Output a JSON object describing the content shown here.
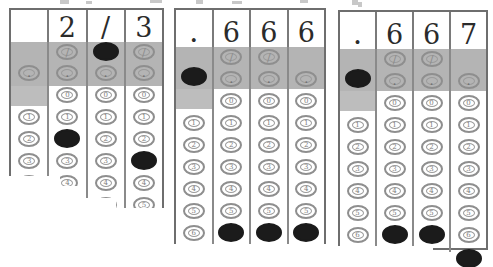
{
  "document": {
    "kind": "scanned-answer-grids",
    "description": "Three standardized test grid-in answer boxes showing equivalent answers for two thirds",
    "grid_count": 3
  },
  "colors": {
    "page_background": "#ffffff",
    "grid_border": "#6e6e6e",
    "column_divider": "#8a8a8a",
    "shaded_band": "#b4b4b4",
    "bubble_outline": "#8e8e8e",
    "bubble_filled": "#1b1b1b",
    "handwriting": "#2b2b2b"
  },
  "bubble_labels": {
    "slash": "/",
    "decimal": ".",
    "digits": [
      "0",
      "1",
      "2",
      "3",
      "4",
      "5",
      "6",
      "7",
      "8",
      "9"
    ]
  },
  "grids": [
    {
      "id": "grid-1",
      "answer": "2/3",
      "written": [
        "",
        "2",
        "/",
        "3"
      ],
      "columns": [
        {
          "index": 1,
          "written": "",
          "has_slash": false,
          "has_decimal": true,
          "filled": null
        },
        {
          "index": 2,
          "written": "2",
          "has_slash": true,
          "has_decimal": true,
          "filled": "2"
        },
        {
          "index": 3,
          "written": "/",
          "has_slash": true,
          "has_decimal": true,
          "filled": "slash"
        },
        {
          "index": 4,
          "written": "3",
          "has_slash": true,
          "has_decimal": true,
          "filled": "3"
        }
      ]
    },
    {
      "id": "grid-2",
      "answer": ".666",
      "written": [
        ".",
        "6",
        "6",
        "6"
      ],
      "columns": [
        {
          "index": 1,
          "written": ".",
          "has_slash": false,
          "has_decimal": true,
          "filled": "decimal"
        },
        {
          "index": 2,
          "written": "6",
          "has_slash": true,
          "has_decimal": true,
          "filled": "6"
        },
        {
          "index": 3,
          "written": "6",
          "has_slash": true,
          "has_decimal": true,
          "filled": "6"
        },
        {
          "index": 4,
          "written": "6",
          "has_slash": false,
          "has_decimal": true,
          "filled": "6"
        }
      ]
    },
    {
      "id": "grid-3",
      "answer": ".667",
      "written": [
        ".",
        "6",
        "6",
        "7"
      ],
      "columns": [
        {
          "index": 1,
          "written": ".",
          "has_slash": false,
          "has_decimal": true,
          "filled": "decimal"
        },
        {
          "index": 2,
          "written": "6",
          "has_slash": true,
          "has_decimal": true,
          "filled": "6"
        },
        {
          "index": 3,
          "written": "6",
          "has_slash": true,
          "has_decimal": true,
          "filled": "6"
        },
        {
          "index": 4,
          "written": "7",
          "has_slash": false,
          "has_decimal": true,
          "filled": "7"
        }
      ]
    }
  ]
}
